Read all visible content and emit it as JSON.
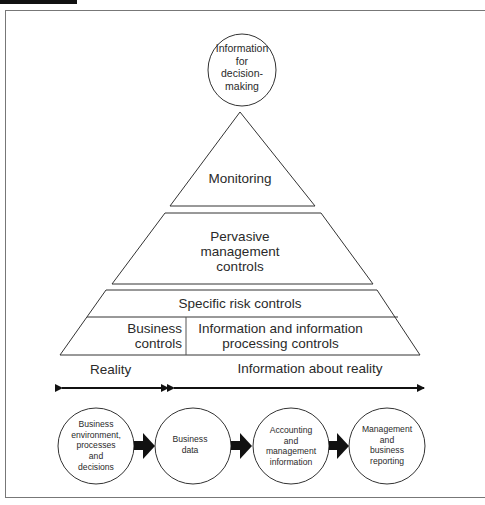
{
  "figure": {
    "title_tab": ""
  },
  "top_circle": {
    "label": "Information for decision-making",
    "lines": [
      "Information",
      "for",
      "decision-",
      "making"
    ]
  },
  "pyramid": {
    "levels": [
      {
        "id": "monitoring",
        "lines": [
          "Monitoring"
        ]
      },
      {
        "id": "pervasive",
        "lines": [
          "Pervasive",
          "management",
          "controls"
        ]
      },
      {
        "id": "specific",
        "lines": [
          "Specific risk controls"
        ]
      },
      {
        "id": "business-controls",
        "lines": [
          "Business",
          "controls"
        ]
      },
      {
        "id": "info-processing",
        "lines": [
          "Information and information",
          "processing controls"
        ]
      }
    ]
  },
  "spans": {
    "reality": "Reality",
    "information_about_reality": "Information about reality"
  },
  "flow": {
    "nodes": [
      {
        "lines": [
          "Business",
          "environment,",
          "processes",
          "and",
          "decisions"
        ]
      },
      {
        "lines": [
          "Business",
          "data"
        ]
      },
      {
        "lines": [
          "Accounting",
          "and",
          "management",
          "information"
        ]
      },
      {
        "lines": [
          "Management",
          "and",
          "business",
          "reporting"
        ]
      }
    ]
  },
  "colors": {
    "line": "#333333",
    "frame": "#777777",
    "text": "#2a2a2a"
  }
}
